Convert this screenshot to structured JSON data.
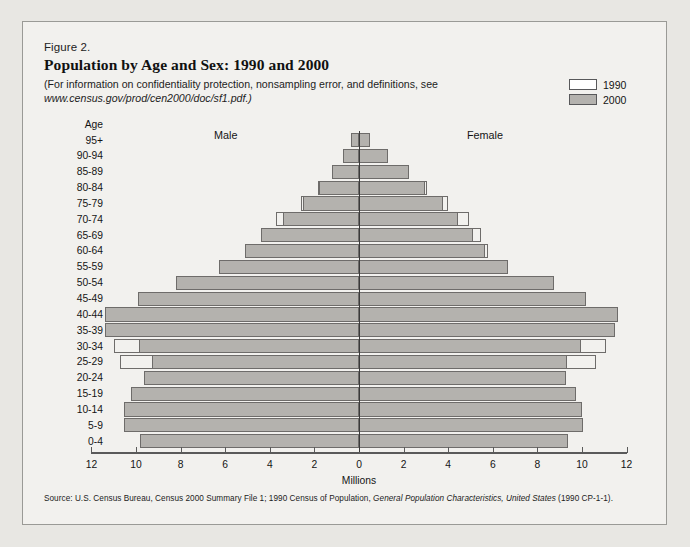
{
  "figure": {
    "number": "Figure 2.",
    "title": "Population by Age and Sex:  1990 and 2000",
    "note_line1": "(For information on confidentiality protection, nonsampling error, and definitions, see",
    "note_line2": "www.census.gov/prod/cen2000/doc/sf1.pdf.)",
    "source": "Source:  U.S. Census Bureau, Census 2000 Summary File 1; 1990 Census of Population, ",
    "source_italic": "General Population Characteristics, United States",
    "source_tail": " (1990 CP-1-1)."
  },
  "legend": {
    "position": "top-right",
    "items": [
      {
        "label": "1990",
        "color": "#ffffff",
        "border": "#58585a"
      },
      {
        "label": "2000",
        "color": "#b4b2ae",
        "border": "#58585a"
      }
    ]
  },
  "labels": {
    "age_header": "Age",
    "male": "Male",
    "female": "Female",
    "xaxis_title": "Millions"
  },
  "colors": {
    "background": "#e8e7e3",
    "panel": "#f2f1ee",
    "bar_2000_fill": "#b4b2ae",
    "bar_1990_fill": "#ffffff",
    "bar_stroke": "#6e6c6a",
    "axis": "#5a5a5a",
    "center_axis": "#3a3a3a"
  },
  "chart_data": {
    "type": "bar",
    "subtype": "population-pyramid",
    "title": "Population by Age and Sex:  1990 and 2000",
    "xlabel": "Millions",
    "ylabel": "Age",
    "xlim": [
      -12,
      12
    ],
    "xticks": [
      12,
      10,
      8,
      6,
      4,
      2,
      0,
      2,
      4,
      6,
      8,
      10,
      12
    ],
    "xtick_labels": [
      "12",
      "10",
      "8",
      "6",
      "4",
      "2",
      "0",
      "2",
      "4",
      "6",
      "8",
      "10",
      "12"
    ],
    "grid": false,
    "legend_position": "top-right",
    "categories": [
      "95+",
      "90-94",
      "85-89",
      "80-84",
      "75-79",
      "70-74",
      "65-69",
      "60-64",
      "55-59",
      "50-54",
      "45-49",
      "40-44",
      "35-39",
      "30-34",
      "25-29",
      "20-24",
      "15-19",
      "10-14",
      "5-9",
      "0-4"
    ],
    "series": [
      {
        "name": "Male 2000",
        "sex": "male",
        "year": "2000",
        "values": [
          0.35,
          0.7,
          1.23,
          1.78,
          2.49,
          3.4,
          4.4,
          5.13,
          6.26,
          8.21,
          9.89,
          11.39,
          11.39,
          9.88,
          9.28,
          9.64,
          10.24,
          10.52,
          10.52,
          9.81
        ]
      },
      {
        "name": "Female 2000",
        "sex": "female",
        "year": "2000",
        "values": [
          0.5,
          1.3,
          2.24,
          2.98,
          3.76,
          4.46,
          5.13,
          5.67,
          6.68,
          8.74,
          10.2,
          11.61,
          11.49,
          9.97,
          9.31,
          9.29,
          9.75,
          10.01,
          10.04,
          9.37
        ]
      },
      {
        "name": "Male 1990",
        "sex": "male",
        "year": "1990",
        "values": [
          0.23,
          0.6,
          1.12,
          1.82,
          2.62,
          3.71,
          4.4,
          4.91,
          5.06,
          5.63,
          6.96,
          8.9,
          10.78,
          11.0,
          10.73,
          9.29,
          8.52,
          8.56,
          9.19,
          9.35
        ]
      },
      {
        "name": "Female 1990",
        "sex": "female",
        "year": "1990",
        "values": [
          0.4,
          1.11,
          2.12,
          3.05,
          4.0,
          4.95,
          5.46,
          5.78,
          5.72,
          6.13,
          7.32,
          9.14,
          10.96,
          11.07,
          10.62,
          9.08,
          8.14,
          8.16,
          8.76,
          8.93
        ]
      }
    ]
  }
}
